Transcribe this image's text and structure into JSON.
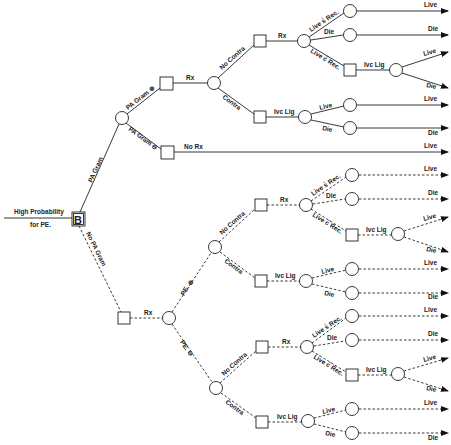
{
  "diagram": {
    "type": "decision-tree",
    "root": {
      "label_line1": "High Probability",
      "label_line2": "for PE.",
      "node_label": "B"
    },
    "branches": {
      "pa_gram": "PA Gram",
      "no_pa_gram": "No PA Gram",
      "pa_gram_pos": "PA Gram ⊕",
      "pa_gram_neg": "PA Gram ⊖",
      "pe_pos": "PE. ⊕",
      "pe_neg": "PE. ⊖",
      "rx": "Rx",
      "no_rx": "No Rx",
      "no_contra": "No Contra",
      "contra": "Contra",
      "ivc_lig": "Ivc Lig",
      "live_no_rec": "Live s̄ Rec.",
      "live_with_rec": "Live c̄ Rec.",
      "live": "Live",
      "die": "Die"
    },
    "outcomes": {
      "upper": [
        "Live",
        "Die",
        "Live",
        "Die",
        "Live",
        "Die"
      ],
      "no_rx": "Live",
      "lower_pe_pos": [
        "Live",
        "Die",
        "Live",
        "Die",
        "Live",
        "Die"
      ],
      "lower_pe_neg": [
        "Live",
        "Die",
        "Live",
        "Die",
        "Live",
        "Die"
      ]
    },
    "legend": {
      "solid_line": "PA Gram performed",
      "dashed_line": "No PA Gram"
    }
  }
}
